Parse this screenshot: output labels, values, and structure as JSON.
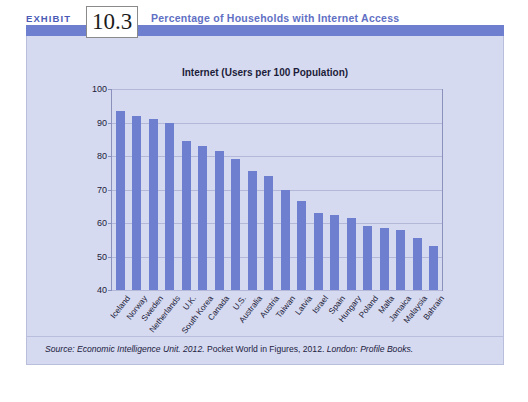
{
  "header": {
    "exhibit_word": "EXHIBIT",
    "exhibit_number": "10.3",
    "title": "Percentage of Households with Internet Access"
  },
  "source": {
    "prefix": "Source: ",
    "part_italic_1": "Economic Intelligence Unit. 2012.",
    "part_upright": " Pocket World in Figures, 2012. ",
    "part_italic_2": "London: Profile Books.",
    "full": "Source: Economic Intelligence Unit. 2012. Pocket World in Figures, 2012. London: Profile Books."
  },
  "colors": {
    "bar": "#6f7fd0",
    "band": "#6f7fd0",
    "panel": "#d6daf0",
    "header_title": "#6170c4",
    "grid": "#b3b8d8",
    "axis": "#8b91bd"
  },
  "chart_data": {
    "type": "bar",
    "title": "Internet (Users per 100 Population)",
    "xlabel": "",
    "ylabel": "",
    "ylim": [
      40,
      100
    ],
    "yticks": [
      40,
      50,
      60,
      70,
      80,
      90,
      100
    ],
    "grid": true,
    "legend": "none",
    "categories": [
      "Iceland",
      "Norway",
      "Sweden",
      "Netherlands",
      "U.K.",
      "South Korea",
      "Canada",
      "U.S.",
      "Australia",
      "Austria",
      "Taiwan",
      "Latvia",
      "Israel",
      "Spain",
      "Hungary",
      "Poland",
      "Malta",
      "Jamaica",
      "Malaysia",
      "Bahrain"
    ],
    "values": [
      93.5,
      92.0,
      91.0,
      90.0,
      84.5,
      83.0,
      81.5,
      79.0,
      75.5,
      74.0,
      70.0,
      66.5,
      63.0,
      62.5,
      61.5,
      59.0,
      58.5,
      58.0,
      55.5,
      53.0
    ]
  }
}
